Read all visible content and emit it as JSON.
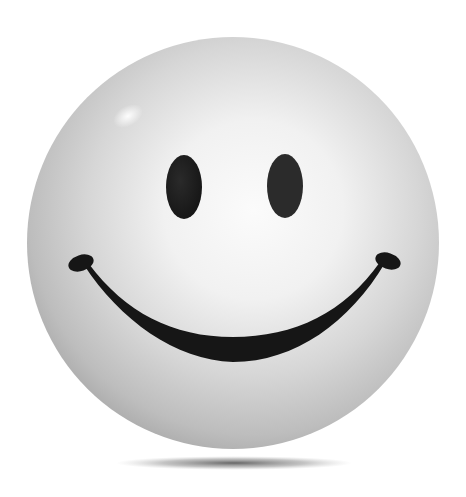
{
  "image": {
    "subject": "3D smiley face ball",
    "alt": "Glossy grayscale smiley face sphere with a soft shadow beneath",
    "colors": {
      "background": "#ffffff",
      "sphere_center": "#f6f6f6",
      "sphere_mid": "#d9d9d9",
      "sphere_edge": "#a9a9a9",
      "features": "#1a1a1a",
      "shadow": "#5a5a5a"
    },
    "parts": {
      "left_eye": "left-eye",
      "right_eye": "right-eye",
      "mouth": "smile",
      "highlight": "specular-highlight",
      "shadow": "ground-shadow"
    }
  }
}
